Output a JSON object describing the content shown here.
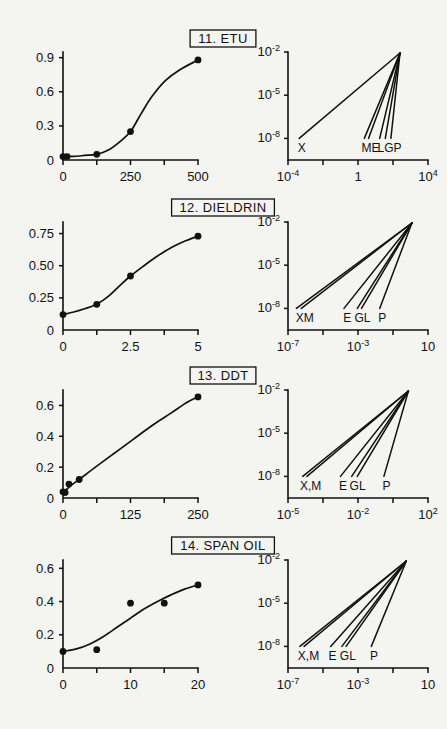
{
  "figure": {
    "background": "#f4f4f1",
    "ink": "#111111",
    "width": 447,
    "height": 729
  },
  "rows": [
    {
      "id": "row-etu",
      "title": "11. ETU",
      "left": {
        "name": "dose-response-etu",
        "yticks": [
          "0",
          "0.3",
          "0.6",
          "0.9"
        ],
        "yvalues": [
          0,
          0.3,
          0.6,
          0.9
        ],
        "ylim": [
          0,
          0.95
        ],
        "xticks": [
          "0",
          "",
          "250",
          "",
          "500"
        ],
        "xvalues": [
          0,
          125,
          250,
          375,
          500
        ],
        "xlim": [
          0,
          500
        ],
        "points": [
          [
            0,
            0.03
          ],
          [
            15,
            0.03
          ],
          [
            125,
            0.05
          ],
          [
            250,
            0.25
          ],
          [
            500,
            0.88
          ]
        ],
        "curve": [
          [
            0,
            0.03
          ],
          [
            40,
            0.032
          ],
          [
            80,
            0.04
          ],
          [
            125,
            0.05
          ],
          [
            170,
            0.09
          ],
          [
            210,
            0.16
          ],
          [
            250,
            0.25
          ],
          [
            290,
            0.41
          ],
          [
            330,
            0.56
          ],
          [
            380,
            0.7
          ],
          [
            430,
            0.79
          ],
          [
            500,
            0.88
          ]
        ]
      },
      "right": {
        "name": "log-extrapolation-etu",
        "yticks": [
          "10",
          "10",
          "10"
        ],
        "yexponents": [
          "-2",
          "-5",
          "-8"
        ],
        "xticks": [
          "10",
          "",
          "1",
          "",
          "10"
        ],
        "xexponents": [
          "-4",
          "",
          "",
          "",
          "4"
        ],
        "xtickcount": 5,
        "rays": [
          {
            "label": "X",
            "x0": 0.08
          },
          {
            "label": "M",
            "x0": 0.545
          },
          {
            "label": "E",
            "x0": 0.575
          },
          {
            "label": "L",
            "x0": 0.655
          },
          {
            "label": "G",
            "x0": 0.695
          },
          {
            "label": "P",
            "x0": 0.735
          }
        ],
        "labels": [
          {
            "text": "X",
            "x": 0.07
          },
          {
            "text": "ME",
            "x": 0.525
          },
          {
            "text": "LGP",
            "x": 0.64
          }
        ],
        "apex": [
          0.8,
          1.0
        ]
      }
    },
    {
      "id": "row-dieldrin",
      "title": "12. DIELDRIN",
      "left": {
        "name": "dose-response-dieldrin",
        "yticks": [
          "0",
          "0.25",
          "0.50",
          "0.75"
        ],
        "yvalues": [
          0,
          0.25,
          0.5,
          0.75
        ],
        "ylim": [
          0,
          0.84
        ],
        "xticks": [
          "0",
          "",
          "2.5",
          "",
          "5"
        ],
        "xvalues": [
          0,
          1.25,
          2.5,
          3.75,
          5
        ],
        "xlim": [
          0,
          5
        ],
        "points": [
          [
            0,
            0.12
          ],
          [
            1.25,
            0.2
          ],
          [
            2.5,
            0.42
          ],
          [
            5,
            0.73
          ]
        ],
        "curve": [
          [
            0,
            0.12
          ],
          [
            0.4,
            0.14
          ],
          [
            0.8,
            0.165
          ],
          [
            1.25,
            0.2
          ],
          [
            1.7,
            0.265
          ],
          [
            2.1,
            0.345
          ],
          [
            2.5,
            0.42
          ],
          [
            3.0,
            0.5
          ],
          [
            3.5,
            0.575
          ],
          [
            4.0,
            0.64
          ],
          [
            4.5,
            0.69
          ],
          [
            5,
            0.73
          ]
        ]
      },
      "right": {
        "name": "log-extrapolation-dieldrin",
        "yticks": [
          "10",
          "10",
          "10"
        ],
        "yexponents": [
          "-2",
          "-5",
          "-8"
        ],
        "xticks": [
          "10",
          "",
          "10",
          "",
          "10"
        ],
        "xexponents": [
          "-7",
          "",
          "-3",
          "",
          ""
        ],
        "xlastlabel": "10",
        "xtickcount": 5,
        "rays": [
          {
            "label": "X",
            "x0": 0.06
          },
          {
            "label": "M",
            "x0": 0.095
          },
          {
            "label": "E",
            "x0": 0.4
          },
          {
            "label": "G",
            "x0": 0.495
          },
          {
            "label": "L",
            "x0": 0.525
          },
          {
            "label": "P",
            "x0": 0.655
          }
        ],
        "labels": [
          {
            "text": "XM",
            "x": 0.055
          },
          {
            "text": "E",
            "x": 0.395
          },
          {
            "text": "GL",
            "x": 0.475
          },
          {
            "text": "P",
            "x": 0.645
          }
        ],
        "apex": [
          0.885,
          1.0
        ]
      }
    },
    {
      "id": "row-ddt",
      "title": "13. DDT",
      "left": {
        "name": "dose-response-ddt",
        "yticks": [
          "0",
          "0.2",
          "0.4",
          "0.6"
        ],
        "yvalues": [
          0,
          0.2,
          0.4,
          0.6
        ],
        "ylim": [
          0,
          0.7
        ],
        "xticks": [
          "0",
          "",
          "125",
          "",
          "250"
        ],
        "xvalues": [
          0,
          62.5,
          125,
          187.5,
          250
        ],
        "xlim": [
          0,
          250
        ],
        "points": [
          [
            0,
            0.04
          ],
          [
            4,
            0.035
          ],
          [
            11,
            0.09
          ],
          [
            30,
            0.12
          ],
          [
            250,
            0.655
          ]
        ],
        "curve": [
          [
            0,
            0.04
          ],
          [
            8,
            0.06
          ],
          [
            18,
            0.09
          ],
          [
            30,
            0.12
          ],
          [
            60,
            0.2
          ],
          [
            95,
            0.29
          ],
          [
            130,
            0.38
          ],
          [
            165,
            0.47
          ],
          [
            200,
            0.55
          ],
          [
            230,
            0.62
          ],
          [
            250,
            0.655
          ]
        ]
      },
      "right": {
        "name": "log-extrapolation-ddt",
        "yticks": [
          "10",
          "10",
          "10"
        ],
        "yexponents": [
          "-2",
          "-5",
          "-8"
        ],
        "xticks": [
          "10",
          "",
          "10",
          "",
          "10"
        ],
        "xexponents": [
          "-5",
          "",
          "-2",
          "",
          "2"
        ],
        "xtickcount": 5,
        "rays": [
          {
            "label": "X",
            "x0": 0.105
          },
          {
            "label": "M",
            "x0": 0.135
          },
          {
            "label": "E",
            "x0": 0.375
          },
          {
            "label": "G",
            "x0": 0.455
          },
          {
            "label": "L",
            "x0": 0.495
          },
          {
            "label": "P",
            "x0": 0.685
          }
        ],
        "labels": [
          {
            "text": "X,M",
            "x": 0.085
          },
          {
            "text": "E",
            "x": 0.365
          },
          {
            "text": "GL",
            "x": 0.44
          },
          {
            "text": "P",
            "x": 0.675
          }
        ],
        "apex": [
          0.86,
          1.0
        ]
      }
    },
    {
      "id": "row-span-oil",
      "title": "14. SPAN OIL",
      "left": {
        "name": "dose-response-span-oil",
        "yticks": [
          "0",
          "0.2",
          "0.4",
          "0.6"
        ],
        "yvalues": [
          0,
          0.2,
          0.4,
          0.6
        ],
        "ylim": [
          0,
          0.65
        ],
        "xticks": [
          "0",
          "",
          "10",
          "",
          "20"
        ],
        "xvalues": [
          0,
          5,
          10,
          15,
          20
        ],
        "xlim": [
          0,
          20
        ],
        "points": [
          [
            0,
            0.1
          ],
          [
            5,
            0.11
          ],
          [
            10,
            0.39
          ],
          [
            15,
            0.39
          ],
          [
            20,
            0.5
          ]
        ],
        "curve": [
          [
            0,
            0.1
          ],
          [
            2,
            0.115
          ],
          [
            4,
            0.145
          ],
          [
            6,
            0.19
          ],
          [
            8,
            0.245
          ],
          [
            10,
            0.3
          ],
          [
            12,
            0.355
          ],
          [
            14,
            0.4
          ],
          [
            16,
            0.44
          ],
          [
            18,
            0.475
          ],
          [
            20,
            0.5
          ]
        ]
      },
      "right": {
        "name": "log-extrapolation-span-oil",
        "yticks": [
          "10",
          "10",
          "10"
        ],
        "yexponents": [
          "-2",
          "-5",
          "-8"
        ],
        "xticks": [
          "10",
          "",
          "10",
          "",
          "10"
        ],
        "xexponents": [
          "-7",
          "",
          "-3",
          "",
          ""
        ],
        "xlastlabel": "10",
        "xtickcount": 5,
        "rays": [
          {
            "label": "X",
            "x0": 0.085
          },
          {
            "label": "M",
            "x0": 0.115
          },
          {
            "label": "E",
            "x0": 0.305
          },
          {
            "label": "G",
            "x0": 0.385
          },
          {
            "label": "L",
            "x0": 0.415
          },
          {
            "label": "P",
            "x0": 0.595
          }
        ],
        "labels": [
          {
            "text": "X,M",
            "x": 0.07
          },
          {
            "text": "E",
            "x": 0.29
          },
          {
            "text": "GL",
            "x": 0.37
          },
          {
            "text": "P",
            "x": 0.585
          }
        ],
        "apex": [
          0.845,
          1.0
        ]
      }
    }
  ],
  "chart_data": {
    "type": "line",
    "panel_count": 8,
    "model_keys": [
      "X",
      "M",
      "E",
      "L",
      "G",
      "P"
    ],
    "panels": [
      {
        "title": "11. ETU",
        "left": {
          "type": "scatter-with-fit",
          "x": [
            0,
            15,
            125,
            250,
            500
          ],
          "y": [
            0.03,
            0.03,
            0.05,
            0.25,
            0.88
          ],
          "xlim": [
            0,
            500
          ],
          "ylim": [
            0,
            0.95
          ],
          "xticks": [
            0,
            125,
            250,
            375,
            500
          ],
          "xticklabels": [
            "0",
            "",
            "250",
            "",
            "500"
          ],
          "yticks": [
            0,
            0.3,
            0.6,
            0.9
          ],
          "yticklabels": [
            "0",
            "0.3",
            "0.6",
            "0.9"
          ]
        },
        "right": {
          "type": "line",
          "xscale": "log",
          "yscale": "log",
          "xlim": [
            1e-06,
            10000.0
          ],
          "ylim": [
            1e-09,
            0.01
          ],
          "xticklabels": [
            "10^-4",
            "1",
            "10^4"
          ],
          "yticklabels": [
            "10^-2",
            "10^-5",
            "10^-8"
          ],
          "rays": [
            "X",
            "M",
            "E",
            "L",
            "G",
            "P"
          ]
        }
      },
      {
        "title": "12. DIELDRIN",
        "left": {
          "type": "scatter-with-fit",
          "x": [
            0,
            1.25,
            2.5,
            5
          ],
          "y": [
            0.12,
            0.2,
            0.42,
            0.73
          ],
          "xlim": [
            0,
            5
          ],
          "ylim": [
            0,
            0.84
          ],
          "xticks": [
            0,
            1.25,
            2.5,
            3.75,
            5
          ],
          "xticklabels": [
            "0",
            "",
            "2.5",
            "",
            "5"
          ],
          "yticks": [
            0,
            0.25,
            0.5,
            0.75
          ],
          "yticklabels": [
            "0",
            "0.25",
            "0.50",
            "0.75"
          ]
        },
        "right": {
          "type": "line",
          "xscale": "log",
          "yscale": "log",
          "xlim": [
            1e-09,
            10.0
          ],
          "ylim": [
            1e-09,
            0.01
          ],
          "xticklabels": [
            "10^-7",
            "10^-3",
            "10"
          ],
          "yticklabels": [
            "10^-2",
            "10^-5",
            "10^-8"
          ],
          "rays": [
            "X",
            "M",
            "E",
            "G",
            "L",
            "P"
          ]
        }
      },
      {
        "title": "13. DDT",
        "left": {
          "type": "scatter-with-fit",
          "x": [
            0,
            4,
            11,
            30,
            250
          ],
          "y": [
            0.04,
            0.035,
            0.09,
            0.12,
            0.655
          ],
          "xlim": [
            0,
            250
          ],
          "ylim": [
            0,
            0.7
          ],
          "xticks": [
            0,
            62.5,
            125,
            187.5,
            250
          ],
          "xticklabels": [
            "0",
            "",
            "125",
            "",
            "250"
          ],
          "yticks": [
            0,
            0.2,
            0.4,
            0.6
          ],
          "yticklabels": [
            "0",
            "0.2",
            "0.4",
            "0.6"
          ]
        },
        "right": {
          "type": "line",
          "xscale": "log",
          "yscale": "log",
          "xlim": [
            1e-07,
            100.0
          ],
          "ylim": [
            1e-09,
            0.01
          ],
          "xticklabels": [
            "10^-5",
            "10^-2",
            "10^2"
          ],
          "yticklabels": [
            "10^-2",
            "10^-5",
            "10^-8"
          ],
          "rays": [
            "X",
            "M",
            "E",
            "G",
            "L",
            "P"
          ]
        }
      },
      {
        "title": "14. SPAN OIL",
        "left": {
          "type": "scatter-with-fit",
          "x": [
            0,
            5,
            10,
            15,
            20
          ],
          "y": [
            0.1,
            0.11,
            0.39,
            0.39,
            0.5
          ],
          "xlim": [
            0,
            20
          ],
          "ylim": [
            0,
            0.65
          ],
          "xticks": [
            0,
            5,
            10,
            15,
            20
          ],
          "xticklabels": [
            "0",
            "",
            "10",
            "",
            "20"
          ],
          "yticks": [
            0,
            0.2,
            0.4,
            0.6
          ],
          "yticklabels": [
            "0",
            "0.2",
            "0.4",
            "0.6"
          ]
        },
        "right": {
          "type": "line",
          "xscale": "log",
          "yscale": "log",
          "xlim": [
            1e-09,
            10.0
          ],
          "ylim": [
            1e-09,
            0.01
          ],
          "xticklabels": [
            "10^-7",
            "10^-3",
            "10"
          ],
          "yticklabels": [
            "10^-2",
            "10^-5",
            "10^-8"
          ],
          "rays": [
            "X",
            "M",
            "E",
            "G",
            "L",
            "P"
          ]
        }
      }
    ]
  }
}
